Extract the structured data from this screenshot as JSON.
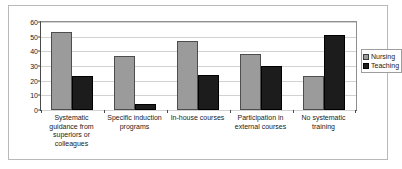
{
  "chart_data": {
    "type": "bar",
    "title": "",
    "xlabel": "",
    "ylabel": "",
    "ylim": [
      0,
      60
    ],
    "yticks": [
      0,
      10,
      20,
      30,
      40,
      50,
      60
    ],
    "grid": true,
    "legend_position": "right",
    "categories": [
      "Systematic guidance from superiors or colleagues",
      "Specific induction programs",
      "In-house courses",
      "Participation in external courses",
      "No systematic training"
    ],
    "series": [
      {
        "name": "Nursing",
        "color": "#9b9b9b",
        "values": [
          53,
          37,
          47,
          38,
          23
        ]
      },
      {
        "name": "Teaching",
        "color": "#1c1c1c",
        "values": [
          23,
          4,
          24,
          30,
          51
        ]
      }
    ]
  }
}
